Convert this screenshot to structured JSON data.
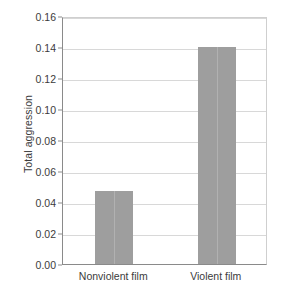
{
  "chart_data": {
    "type": "bar",
    "title": "",
    "xlabel": "",
    "ylabel": "Total aggression",
    "categories": [
      "Nonviolent film",
      "Violent film"
    ],
    "values": [
      0.047,
      0.14
    ],
    "ylim": [
      0.0,
      0.16
    ],
    "ytick_labels": [
      "0.16",
      "0.14",
      "0.12",
      "0.10",
      "0.08",
      "0.06",
      "0.04",
      "0.02",
      "0.00"
    ],
    "ytick_values": [
      0.16,
      0.14,
      0.12,
      0.1,
      0.08,
      0.06,
      0.04,
      0.02,
      0.0
    ],
    "grid": "horizontal",
    "legend": "none",
    "bar_color": "#9e9e9e",
    "gridline_color": "#d8d8d8",
    "axis_color": "#8a8a8a",
    "frame_color": "#cfcfcf",
    "background_color": "#ffffff",
    "text_color": "#3b3b3b"
  }
}
